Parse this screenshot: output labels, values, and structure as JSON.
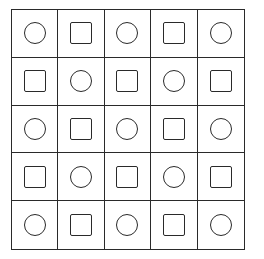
{
  "grid": {
    "rows": 5,
    "cols": 5,
    "line_color": "#2a2a2a",
    "cells": [
      [
        "circle",
        "square",
        "circle",
        "square",
        "circle"
      ],
      [
        "square",
        "circle",
        "square",
        "circle",
        "square"
      ],
      [
        "circle",
        "square",
        "circle",
        "square",
        "circle"
      ],
      [
        "square",
        "circle",
        "square",
        "circle",
        "square"
      ],
      [
        "circle",
        "square",
        "circle",
        "square",
        "circle"
      ]
    ]
  }
}
